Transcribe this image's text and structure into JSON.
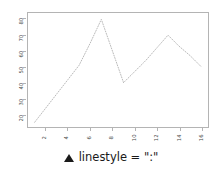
{
  "chart_data": {
    "type": "line",
    "title": "",
    "xlabel": "",
    "ylabel": "",
    "x": [
      1,
      2,
      3,
      4,
      5,
      6,
      7,
      8,
      9,
      10,
      11,
      12,
      13,
      14,
      15,
      16
    ],
    "values": [
      15,
      24,
      33,
      42,
      51,
      65,
      80,
      60,
      40,
      47,
      54,
      62,
      70,
      63,
      57,
      50
    ],
    "series": [
      {
        "name": "linestyle = \":\"",
        "values": [
          15,
          24,
          33,
          42,
          51,
          65,
          80,
          60,
          40,
          47,
          54,
          62,
          70,
          63,
          57,
          50
        ],
        "linestyle": ":",
        "color": "#b9b9b9"
      }
    ],
    "xlim": [
      0.4,
      16.6
    ],
    "ylim": [
      12,
      84
    ],
    "xticks": [
      2,
      4,
      6,
      8,
      10,
      12,
      14,
      16
    ],
    "xticklabels": [
      "2",
      "4",
      "6",
      "8",
      "10",
      "12",
      "14",
      "16"
    ],
    "yticks": [
      20,
      30,
      40,
      50,
      60,
      70,
      80
    ],
    "yticklabels": [
      "20",
      "30",
      "40",
      "50",
      "60",
      "70",
      "80"
    ],
    "grid": false,
    "legend_position": "bottom-center",
    "tick_label_rotation": -90
  },
  "legend": {
    "marker": "triangle-up-marker",
    "label": "linestyle = \":\""
  },
  "colors": {
    "line": "#b9b9b9",
    "frame": "#b4b4b4",
    "tick_text": "#4a4a4a",
    "legend_text": "#1a1a1a",
    "background": "#ffffff"
  }
}
